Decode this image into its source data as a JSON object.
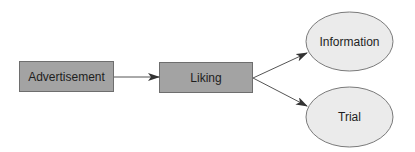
{
  "diagram": {
    "type": "flowchart",
    "colors": {
      "box_fill": "#a3a3a3",
      "box_stroke": "#6e6e6e",
      "ellipse_fill": "#ebebeb",
      "ellipse_stroke": "#7a7a7a",
      "arrow": "#333333",
      "text": "#1e1e1e"
    },
    "nodes": [
      {
        "id": "advertisement",
        "shape": "rectangle",
        "label": "Advertisement"
      },
      {
        "id": "liking",
        "shape": "rectangle",
        "label": "Liking"
      },
      {
        "id": "information",
        "shape": "ellipse",
        "label": "Information"
      },
      {
        "id": "trial",
        "shape": "ellipse",
        "label": "Trial"
      }
    ],
    "edges": [
      {
        "from": "advertisement",
        "to": "liking"
      },
      {
        "from": "liking",
        "to": "information"
      },
      {
        "from": "liking",
        "to": "trial"
      }
    ]
  }
}
